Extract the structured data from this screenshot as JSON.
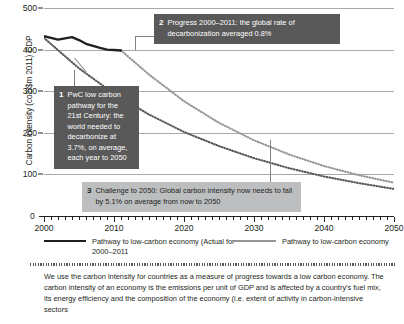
{
  "chart_data": {
    "type": "line",
    "title": "",
    "xlabel": "",
    "ylabel": "Carbon intensity (co2/$m 2011) CDP",
    "xlim": [
      2000,
      2050
    ],
    "ylim": [
      0,
      500
    ],
    "yticks": [
      100,
      200,
      300,
      400,
      500
    ],
    "xticks": [
      2000,
      2010,
      2020,
      2030,
      2040,
      2050
    ],
    "xtick_minor_step": 1,
    "grid": "horizontal",
    "legend_position": "below-axis",
    "series": [
      {
        "name": "Pathway to low-carbon economy (Actual for 2000–2011",
        "style": "solid",
        "color": "#231f20",
        "x": [
          2000,
          2001,
          2002,
          2003,
          2004,
          2005,
          2006,
          2007,
          2008,
          2009,
          2010,
          2011
        ],
        "values": [
          432,
          428,
          424,
          427,
          430,
          423,
          414,
          409,
          404,
          400,
          399,
          398
        ]
      },
      {
        "name": "PwC low carbon pathway (3.7% per year from 2000)",
        "style": "dotted",
        "color": "#58595b",
        "x": [
          2000,
          2005,
          2010,
          2015,
          2020,
          2025,
          2030,
          2035,
          2040,
          2045,
          2050
        ],
        "values": [
          428,
          355,
          294,
          244,
          202,
          168,
          139,
          115,
          95,
          79,
          65
        ]
      },
      {
        "name": "Pathway to low-carbon economy",
        "style": "dotted",
        "color": "#939598",
        "x": [
          2011,
          2015,
          2020,
          2025,
          2030,
          2035,
          2040,
          2045,
          2050
        ],
        "values": [
          398,
          340,
          276,
          224,
          182,
          148,
          120,
          98,
          80
        ]
      }
    ],
    "annotations": [
      {
        "id": "1",
        "number": "1",
        "text": "PwC low carbon pathway for the 21st Century: the world needed to decarbonize at 3.7%, on average, each year to 2050",
        "style": "dark"
      },
      {
        "id": "2",
        "number": "2",
        "text": "Progress 2000–2011: the global rate of decarbonization averaged 0.8%",
        "style": "dark"
      },
      {
        "id": "3",
        "number": "3",
        "text": "Challenge to 2050: Global carbon intensity now needs to fall by 5.1% on average from now to 2050",
        "style": "light"
      }
    ],
    "legend": [
      {
        "label": "Pathway to low-carbon economy (Actual for 2000–2011",
        "color": "#231f20"
      },
      {
        "label": "Pathway to low-carbon economy",
        "color": "#939598"
      }
    ],
    "zero_label": "0"
  },
  "footnote": {
    "text": "We use the carbon intensity for countries as a measure of progress towards a low carbon economy. The carbon intensity of an economy is the emissions per unit of GDP and is affected by a country's fuel mix, its energy efficiency and the composition of the economy (i.e. extent of activity in carbon-intensive sectors"
  }
}
